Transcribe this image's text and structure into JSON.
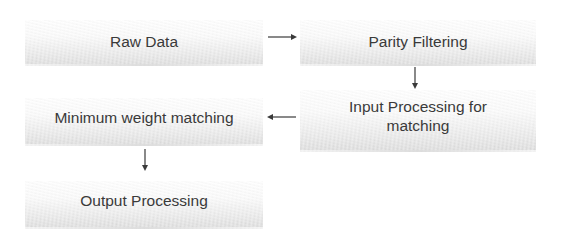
{
  "diagram": {
    "type": "flowchart",
    "nodes": [
      {
        "id": "raw",
        "label": "Raw Data"
      },
      {
        "id": "parity",
        "label": "Parity Filtering"
      },
      {
        "id": "input",
        "label_line1": "Input Processing for",
        "label_line2": "matching"
      },
      {
        "id": "minweight",
        "label": "Minimum weight matching"
      },
      {
        "id": "output",
        "label": "Output Processing"
      }
    ],
    "edges": [
      {
        "from": "raw",
        "to": "parity",
        "direction": "right"
      },
      {
        "from": "parity",
        "to": "input",
        "direction": "down"
      },
      {
        "from": "input",
        "to": "minweight",
        "direction": "left"
      },
      {
        "from": "minweight",
        "to": "output",
        "direction": "down"
      }
    ],
    "colors": {
      "text": "#3a3a3a",
      "arrow": "#3a3a3a",
      "box_fill_top": "#ffffff",
      "box_fill_bottom": "#dcdcdc",
      "background": "#ffffff"
    }
  }
}
